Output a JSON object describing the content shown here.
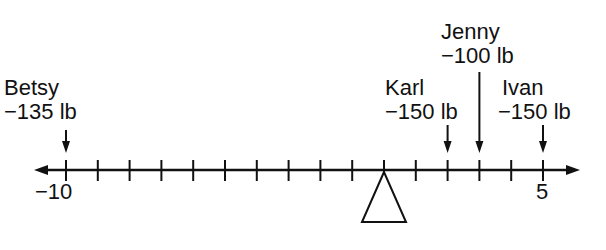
{
  "diagram": {
    "type": "number-line-seesaw",
    "axis": {
      "min": -10,
      "max": 5,
      "step": 1,
      "labeled_ticks": [
        {
          "value": -10,
          "label": "−10"
        },
        {
          "value": 5,
          "label": "5"
        }
      ],
      "fulcrum_at": 0
    },
    "people": [
      {
        "name": "Betsy",
        "weight": "−135 lb",
        "position": -10
      },
      {
        "name": "Karl",
        "weight": "−150 lb",
        "position": 2
      },
      {
        "name": "Jenny",
        "weight": "−100 lb",
        "position": 3
      },
      {
        "name": "Ivan",
        "weight": "−150 lb",
        "position": 5
      }
    ],
    "colors": {
      "ink": "#111111",
      "background": "#ffffff"
    }
  }
}
